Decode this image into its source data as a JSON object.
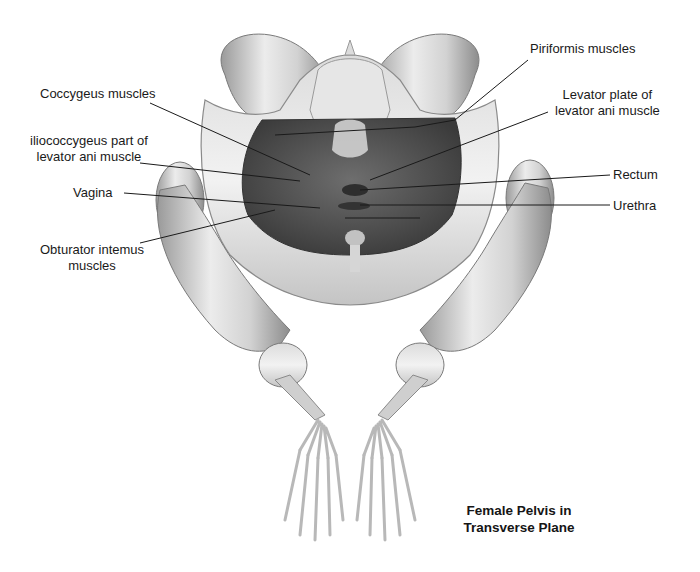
{
  "figure": {
    "title_line1": "Female Pelvis in",
    "title_line2": "Transverse Plane"
  },
  "labels": {
    "left": [
      {
        "id": "coccygeus",
        "line1": "Coccygeus muscles"
      },
      {
        "id": "iliococcygeus",
        "line1": "iliococcygeus part of",
        "line2": "levator ani muscle"
      },
      {
        "id": "vagina",
        "line1": "Vagina"
      },
      {
        "id": "obturator",
        "line1": "Obturator intemus",
        "line2": "muscles"
      }
    ],
    "right": [
      {
        "id": "piriformis",
        "line1": "Piriformis muscles"
      },
      {
        "id": "levator-plate",
        "line1": "Levator plate of",
        "line2": "levator ani muscle"
      },
      {
        "id": "rectum",
        "line1": "Rectum"
      },
      {
        "id": "urethra",
        "line1": "Urethra"
      }
    ]
  },
  "colors": {
    "bone_light": "#e8e8e8",
    "bone_mid": "#bdbdbd",
    "bone_dark": "#8a8a8a",
    "muscle": "#5a5a5a",
    "muscle_dark": "#3e3e3e",
    "leader_line": "#1a1a1a"
  }
}
